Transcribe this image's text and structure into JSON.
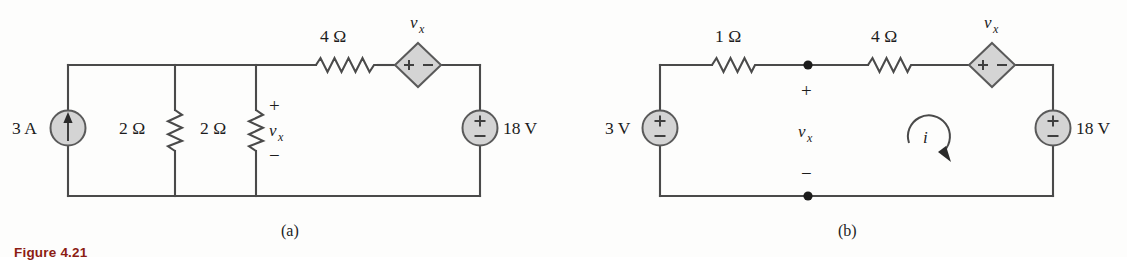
{
  "figure": {
    "caption": "Figure 4.21",
    "subfigures": [
      {
        "id": "a",
        "label": "(a)"
      },
      {
        "id": "b",
        "label": "(b)"
      }
    ]
  },
  "circuit_a": {
    "components": [
      {
        "name": "current-source",
        "label": "3 A",
        "symbol": "circle-up-arrow"
      },
      {
        "name": "resistor-left",
        "label": "2 Ω",
        "orientation": "vertical"
      },
      {
        "name": "resistor-middle",
        "label": "2 Ω",
        "orientation": "vertical"
      },
      {
        "name": "resistor-top",
        "label": "4 Ω",
        "orientation": "horizontal"
      },
      {
        "name": "dependent-voltage-source",
        "label": "v",
        "subscript": "x",
        "symbol": "diamond",
        "plus": "+",
        "minus": "−"
      },
      {
        "name": "voltage-source",
        "label": "18 V",
        "symbol": "circle-plus-minus"
      }
    ],
    "annotations": {
      "vx_plus": "+",
      "vx_name": "v",
      "vx_sub": "x",
      "vx_minus": "−"
    }
  },
  "circuit_b": {
    "components": [
      {
        "name": "voltage-source-left",
        "label": "3 V",
        "symbol": "circle-plus-minus"
      },
      {
        "name": "resistor-1ohm",
        "label": "1 Ω",
        "orientation": "horizontal"
      },
      {
        "name": "resistor-4ohm",
        "label": "4 Ω",
        "orientation": "horizontal"
      },
      {
        "name": "dependent-voltage-source",
        "label": "v",
        "subscript": "x",
        "symbol": "diamond",
        "plus": "+",
        "minus": "−"
      },
      {
        "name": "voltage-source-right",
        "label": "18 V",
        "symbol": "circle-plus-minus"
      }
    ],
    "annotations": {
      "vx_plus": "+",
      "vx_name": "v",
      "vx_sub": "x",
      "vx_minus": "−",
      "mesh_current": "i"
    }
  },
  "colors": {
    "wire": "#4a4a4a",
    "source_fill": "#d4d4d4",
    "source_stroke": "#5a5a5a",
    "text": "#1c1c1c",
    "caption": "#8c1c13",
    "page_bg": "#fdfdfc"
  }
}
